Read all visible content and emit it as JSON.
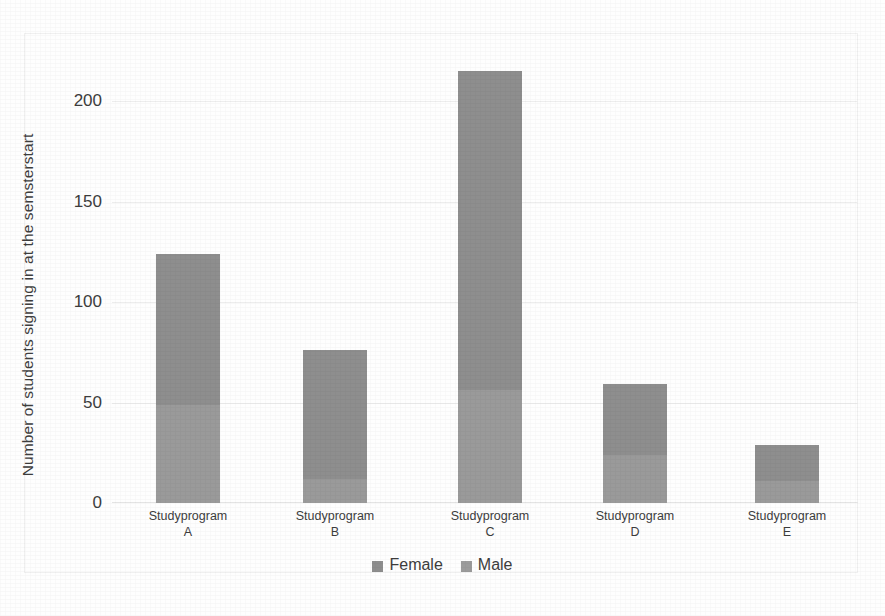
{
  "chart_data": {
    "type": "bar",
    "subtype": "stacked-vertical",
    "title": "",
    "xlabel": "",
    "ylabel": "Number of students signing in at the semsterstart",
    "ylim": [
      0,
      215
    ],
    "yticks": [
      0,
      50,
      100,
      150,
      200
    ],
    "ytick_labels": [
      "0",
      "50",
      "100",
      "150",
      "200"
    ],
    "grid": true,
    "grid_axis": "y",
    "legend_position": "bottom-center",
    "categories": [
      "Studyprogram A",
      "Studyprogram B",
      "Studyprogram C",
      "Studyprogram D",
      "Studyprogram E"
    ],
    "category_lines": [
      {
        "name": "Studyprogram",
        "letter": "A"
      },
      {
        "name": "Studyprogram",
        "letter": "B"
      },
      {
        "name": "Studyprogram",
        "letter": "C"
      },
      {
        "name": "Studyprogram",
        "letter": "D"
      },
      {
        "name": "Studyprogram",
        "letter": "E"
      }
    ],
    "series": [
      {
        "name": "Male",
        "color": "#9a9a9a",
        "values": [
          49,
          12,
          56,
          24,
          11
        ]
      },
      {
        "name": "Female",
        "color": "#8e8e8e",
        "values": [
          75,
          64,
          159,
          35,
          18
        ]
      }
    ],
    "totals": [
      124,
      76,
      215,
      59,
      29
    ]
  },
  "legend": {
    "items": [
      {
        "label": "Female",
        "color": "#8e8e8e"
      },
      {
        "label": "Male",
        "color": "#9c9c9c"
      }
    ]
  },
  "axes": {
    "y_title": "Number of students signing in at the semsterstart",
    "y_ticks": [
      {
        "value": 200,
        "label": "200"
      },
      {
        "value": 150,
        "label": "150"
      },
      {
        "value": 100,
        "label": "100"
      },
      {
        "value": 50,
        "label": "50"
      },
      {
        "value": 0,
        "label": "0"
      }
    ]
  },
  "style": {
    "background": "#fefefe",
    "grid_color": "#ededed",
    "text_color": "#3d3d3d",
    "bar_female": "#8e8e8e",
    "bar_male": "#9c9c9c"
  }
}
